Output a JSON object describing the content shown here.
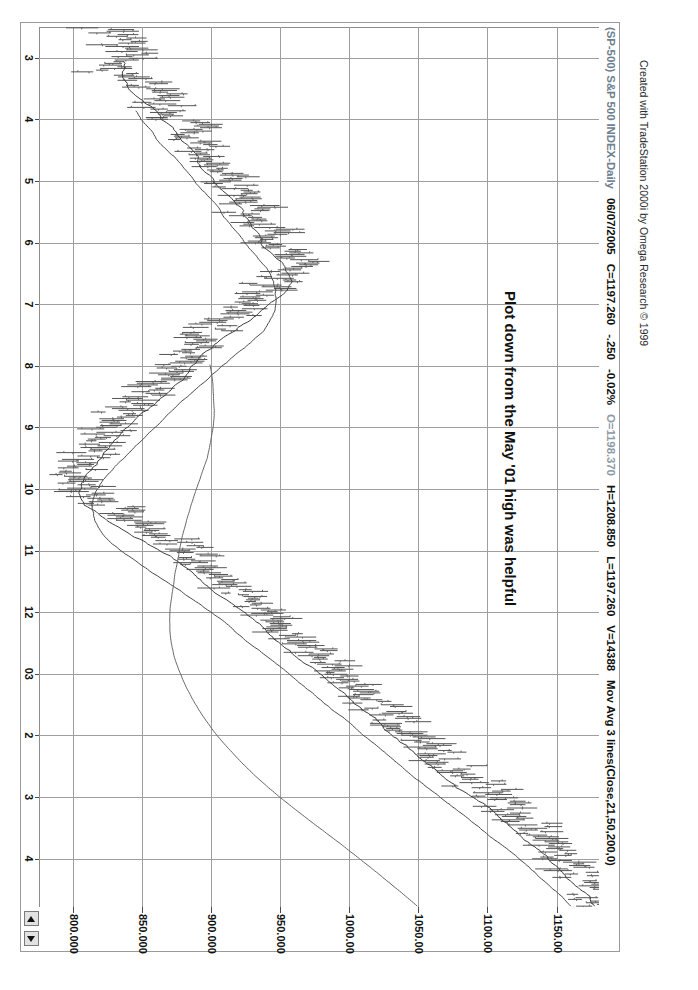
{
  "window": {
    "title_bar": {
      "symbol": "(SP-500) S&P 500 INDEX-Daily",
      "date": "06/07/2005",
      "close": "C=1197.260",
      "change": "-.250",
      "change_pct": "-0.02%",
      "open": "O=1198.370",
      "high": "H=1208.850",
      "low": "L=1197.260",
      "volume": "V=14388",
      "indicator": "Mov Avg 3 lines(Close,21,50,200,0)"
    },
    "scroll_up_label": "scroll-up",
    "scroll_down_label": "scroll-down"
  },
  "annotation": {
    "text": "Plot down from the May '01 high was helpful"
  },
  "credit": {
    "text": "Created with TradeStation 2000i by Omega Research © 1999"
  },
  "chart_data": {
    "type": "line",
    "subtype": "ohlc-bar-chart-with-moving-averages",
    "title": "(SP-500) S&P 500 INDEX-Daily",
    "xlabel": "",
    "ylabel": "",
    "grid": true,
    "legend_position": "none",
    "ylim": [
      775,
      1180
    ],
    "ytick_labels": [
      "1150.00",
      "1100.00",
      "1050.00",
      "1000.00",
      "950.000",
      "900.000",
      "850.000",
      "800.000"
    ],
    "ytick_values": [
      1150.0,
      1100.0,
      1050.0,
      1000.0,
      950.0,
      900.0,
      850.0,
      800.0
    ],
    "xtick_labels": [
      "3",
      "4",
      "5",
      "6",
      "7",
      "8",
      "9",
      "10",
      "11",
      "12",
      "03",
      "2",
      "3",
      "4"
    ],
    "xtick_positions": [
      0.035,
      0.105,
      0.175,
      0.245,
      0.315,
      0.385,
      0.455,
      0.525,
      0.595,
      0.665,
      0.735,
      0.805,
      0.875,
      0.945
    ],
    "annotations": [
      {
        "text": "Plot down from the May '01 high was helpful",
        "x": 0.3,
        "y": 1115
      }
    ],
    "series": [
      {
        "name": "Close (daily bars)",
        "color": "#555555",
        "type": "ohlc",
        "x": [
          0.0,
          0.01,
          0.02,
          0.03,
          0.04,
          0.05,
          0.06,
          0.07,
          0.08,
          0.09,
          0.1,
          0.11,
          0.12,
          0.13,
          0.14,
          0.15,
          0.16,
          0.17,
          0.18,
          0.19,
          0.2,
          0.21,
          0.22,
          0.23,
          0.24,
          0.25,
          0.26,
          0.27,
          0.28,
          0.29,
          0.3,
          0.31,
          0.32,
          0.33,
          0.34,
          0.35,
          0.36,
          0.37,
          0.38,
          0.39,
          0.4,
          0.41,
          0.42,
          0.43,
          0.44,
          0.45,
          0.46,
          0.47,
          0.48,
          0.49,
          0.5,
          0.51,
          0.52,
          0.53,
          0.54,
          0.55,
          0.56,
          0.57,
          0.58,
          0.59,
          0.6,
          0.61,
          0.62,
          0.63,
          0.64,
          0.65,
          0.66,
          0.67,
          0.68,
          0.69,
          0.7,
          0.71,
          0.72,
          0.73,
          0.74,
          0.75,
          0.76,
          0.77,
          0.78,
          0.79,
          0.8,
          0.81,
          0.82,
          0.83,
          0.84,
          0.85,
          0.86,
          0.87,
          0.88,
          0.89,
          0.9,
          0.91,
          0.92,
          0.93,
          0.94,
          0.95,
          0.96,
          0.97,
          0.98,
          0.99
        ],
        "values": [
          820,
          826,
          835,
          842,
          838,
          830,
          845,
          858,
          866,
          860,
          872,
          884,
          878,
          890,
          902,
          896,
          908,
          916,
          910,
          922,
          930,
          926,
          938,
          946,
          940,
          952,
          960,
          955,
          948,
          940,
          932,
          925,
          918,
          910,
          902,
          895,
          888,
          880,
          872,
          866,
          860,
          854,
          848,
          842,
          836,
          830,
          824,
          818,
          812,
          806,
          800,
          796,
          806,
          818,
          830,
          842,
          854,
          866,
          874,
          882,
          890,
          898,
          906,
          914,
          922,
          930,
          938,
          946,
          954,
          962,
          970,
          978,
          986,
          994,
          1002,
          1010,
          1018,
          1026,
          1034,
          1042,
          1050,
          1058,
          1066,
          1074,
          1082,
          1090,
          1098,
          1106,
          1114,
          1122,
          1130,
          1138,
          1146,
          1152,
          1158,
          1164,
          1170,
          1176,
          1180,
          1178
        ],
        "high": [
          826,
          834,
          843,
          850,
          846,
          840,
          854,
          866,
          874,
          870,
          882,
          892,
          888,
          898,
          910,
          906,
          918,
          924,
          920,
          932,
          940,
          936,
          948,
          954,
          950,
          962,
          968,
          964,
          958,
          950,
          942,
          934,
          928,
          920,
          912,
          904,
          898,
          890,
          882,
          876,
          870,
          864,
          858,
          852,
          846,
          840,
          834,
          828,
          822,
          816,
          812,
          808,
          818,
          830,
          842,
          854,
          866,
          876,
          884,
          892,
          900,
          908,
          916,
          924,
          932,
          940,
          948,
          956,
          964,
          972,
          980,
          988,
          996,
          1004,
          1012,
          1020,
          1028,
          1036,
          1044,
          1052,
          1060,
          1068,
          1076,
          1084,
          1092,
          1100,
          1108,
          1116,
          1124,
          1132,
          1140,
          1148,
          1155,
          1161,
          1167,
          1173,
          1179,
          1185,
          1188,
          1186
        ],
        "low": [
          812,
          818,
          827,
          834,
          830,
          822,
          836,
          850,
          858,
          852,
          864,
          876,
          870,
          882,
          894,
          888,
          900,
          908,
          902,
          914,
          922,
          918,
          930,
          938,
          932,
          944,
          952,
          947,
          940,
          932,
          924,
          917,
          910,
          902,
          894,
          887,
          880,
          872,
          864,
          858,
          852,
          846,
          840,
          834,
          828,
          822,
          816,
          810,
          804,
          798,
          792,
          788,
          798,
          810,
          822,
          834,
          846,
          858,
          866,
          874,
          882,
          890,
          898,
          906,
          914,
          922,
          930,
          938,
          946,
          954,
          962,
          970,
          978,
          986,
          994,
          1002,
          1010,
          1018,
          1026,
          1034,
          1042,
          1050,
          1058,
          1066,
          1074,
          1082,
          1090,
          1098,
          1106,
          1114,
          1120,
          1126,
          1132,
          1138,
          1144,
          1150,
          1156,
          1162,
          1166,
          1164
        ]
      },
      {
        "name": "Mov Avg 21",
        "color": "#3c3c3c",
        "length": 21
      },
      {
        "name": "Mov Avg 50",
        "color": "#4a4a4a",
        "length": 50
      },
      {
        "name": "Mov Avg 200",
        "color": "#666666",
        "length": 200
      }
    ]
  }
}
